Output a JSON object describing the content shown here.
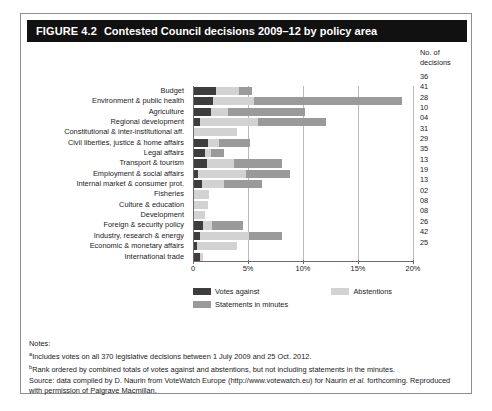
{
  "figure": {
    "number_label": "FIGURE 4.2",
    "title": "Contested Council decisions 2009–12 by policy area"
  },
  "right_column": {
    "header_line1": "No. of",
    "header_line2": "decisions"
  },
  "legend": {
    "votes_against": "Votes against",
    "abstentions": "Abstentions",
    "statements": "Statements in minutes"
  },
  "notes": {
    "heading": "Notes:",
    "note_a_marker": "a",
    "note_a": "Includes votes on all 370 legislative decisions between 1 July 2009 and 25 Oct. 2012.",
    "note_b_marker": "b",
    "note_b": "Rank ordered by combined totals of votes against and abstentions, but not including statements in the minutes.",
    "source_prefix": "Source: data compiled by D. Naurin from VoteWatch Europe (http://www.votewatch.eu) for Naurin ",
    "source_italic": "et al.",
    "source_suffix": " forthcoming. Reproduced with permission of Palgrave Macmillan."
  },
  "chart_data": {
    "type": "bar",
    "orientation": "horizontal",
    "stacked": true,
    "title": "Contested Council decisions 2009–12 by policy area",
    "xlabel": "",
    "ylabel": "",
    "xlim": [
      0,
      20
    ],
    "xticks": [
      0,
      5,
      10,
      15,
      20
    ],
    "xticklabels": [
      "0",
      "5%",
      "10%",
      "15%",
      "20%"
    ],
    "grid": true,
    "legend_position": "below-axes",
    "colors": {
      "votes_against": "#3d3d3d",
      "abstentions": "#d2d2d2",
      "statements": "#9a9a9a",
      "title_bar": "#111111",
      "gridline": "#b9b9b9",
      "axis": "#6b6b6b"
    },
    "categories": [
      "Budget",
      "Environment & public health",
      "Agriculture",
      "Regional development",
      "Constitutional & inter-institutional aff.",
      "Civil liberties, justice & home affairs",
      "Legal affairs",
      "Transport & tourism",
      "Employment & social affairs",
      "Internal market & consumer prot.",
      "Fisheries",
      "Culture & education",
      "Development",
      "Foreign & security policy",
      "Industry, research & energy",
      "Economic & monetary affairs",
      "International trade"
    ],
    "series": [
      {
        "name": "Votes against",
        "values": [
          2.0,
          1.7,
          1.5,
          0.5,
          0.0,
          1.3,
          1.0,
          1.2,
          0.4,
          0.7,
          0.0,
          0.0,
          0.0,
          0.8,
          0.5,
          0.3,
          0.5
        ]
      },
      {
        "name": "Abstentions",
        "values": [
          2.1,
          3.8,
          1.6,
          5.3,
          3.9,
          1.0,
          0.5,
          2.4,
          4.3,
          2.0,
          1.4,
          1.3,
          1.0,
          0.8,
          4.5,
          3.6,
          0.3
        ]
      },
      {
        "name": "Statements in minutes",
        "values": [
          1.2,
          13.4,
          7.0,
          6.2,
          0.0,
          2.8,
          1.2,
          4.4,
          4.0,
          3.5,
          0.0,
          0.0,
          0.0,
          2.9,
          3.0,
          0.0,
          0.0
        ]
      }
    ],
    "decision_counts": [
      "36",
      "41",
      "28",
      "10",
      "04",
      "31",
      "29",
      "35",
      "13",
      "19",
      "13",
      "02",
      "08",
      "08",
      "26",
      "42",
      "25"
    ]
  }
}
